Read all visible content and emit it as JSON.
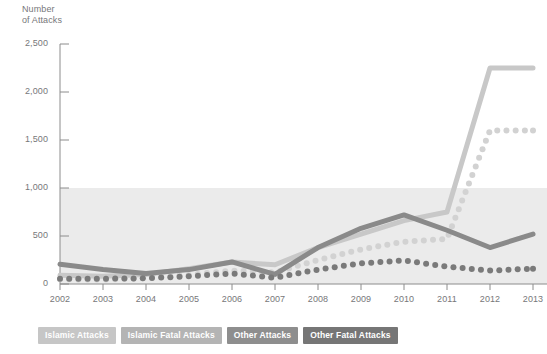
{
  "chart_data": {
    "type": "line",
    "title": "",
    "ylabel": "Number\nof Attacks",
    "xlabel": "",
    "ylim": [
      0,
      2500
    ],
    "ytick_values": [
      0,
      500,
      1000,
      1500,
      2000,
      2500
    ],
    "ytick_labels": [
      "0",
      "500",
      "1,000",
      "1,500",
      "2,000",
      "2,500"
    ],
    "categories": [
      "2002",
      "2003",
      "2004",
      "2005",
      "2006",
      "2007",
      "2008",
      "2009",
      "2010",
      "2011",
      "2012",
      "2013"
    ],
    "grid": false,
    "legend_position": "bottom-left",
    "shaded_band": {
      "from": 0,
      "to": 1000,
      "color": "#ebebeb"
    },
    "series": [
      {
        "name": "Islamic Attacks",
        "style": "solid",
        "color": "#c8c8c8",
        "values": [
          90,
          80,
          100,
          160,
          230,
          200,
          380,
          520,
          660,
          750,
          2250,
          2250
        ]
      },
      {
        "name": "Islamic Fatal Attacks",
        "style": "dotted",
        "color": "#d2d2d2",
        "values": [
          50,
          45,
          60,
          95,
          140,
          120,
          250,
          360,
          440,
          470,
          1600,
          1600
        ]
      },
      {
        "name": "Other Attacks",
        "style": "solid",
        "color": "#8a8a8a",
        "values": [
          205,
          150,
          110,
          150,
          230,
          100,
          380,
          580,
          720,
          560,
          380,
          520
        ]
      },
      {
        "name": "Other Fatal Attacks",
        "style": "dotted",
        "color": "#7a7a7a",
        "values": [
          55,
          55,
          60,
          80,
          110,
          65,
          150,
          215,
          245,
          180,
          140,
          160
        ]
      }
    ],
    "colors": {
      "islamic_attacks": "#c8c8c8",
      "islamic_fatal_attacks": "#d2d2d2",
      "other_attacks": "#8a8a8a",
      "other_fatal_attacks": "#7a7a7a",
      "axis": "#8c8c8c",
      "text": "#77777a",
      "band": "#ebebeb",
      "background": "#ffffff"
    }
  },
  "legend": {
    "items": [
      {
        "label": "Islamic Attacks",
        "color": "#c6c6c6"
      },
      {
        "label": "Islamic Fatal Attacks",
        "color": "#b4b4b4"
      },
      {
        "label": "Other Attacks",
        "color": "#8e8e8e"
      },
      {
        "label": "Other Fatal Attacks",
        "color": "#767676"
      }
    ]
  }
}
